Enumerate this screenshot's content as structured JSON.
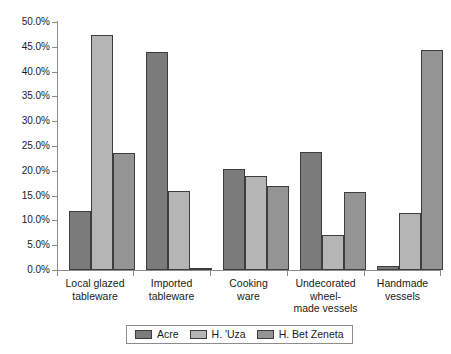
{
  "chart_data": {
    "type": "bar",
    "title": "",
    "subtitle": "",
    "xlabel": "",
    "ylabel": "",
    "ylim": [
      0,
      50
    ],
    "y_tick_step": 5,
    "y_tick_labels": [
      "0.0%",
      "5.0%",
      "10.0%",
      "15.0%",
      "20.0%",
      "25.0%",
      "30.0%",
      "35.0%",
      "40.0%",
      "45.0%",
      "50.0%"
    ],
    "y_tick_values": [
      0,
      5,
      10,
      15,
      20,
      25,
      30,
      35,
      40,
      45,
      50
    ],
    "value_unit": "%",
    "grid": false,
    "legend_position": "bottom",
    "categories": [
      "Local glazed tableware",
      "Imported tableware",
      "Cooking ware",
      "Undecorated wheel-made vessels",
      "Handmade vessels"
    ],
    "category_label_lines": [
      [
        "Local glazed",
        "tableware"
      ],
      [
        "Imported",
        "tableware"
      ],
      [
        "Cooking",
        "ware"
      ],
      [
        "Undecorated",
        "wheel-",
        "made vessels"
      ],
      [
        "Handmade",
        "vessels"
      ]
    ],
    "series": [
      {
        "name": "Acre",
        "color": "#7b7b7b",
        "values": [
          11.9,
          43.9,
          20.4,
          23.8,
          0.8
        ]
      },
      {
        "name": "H. 'Uza",
        "color": "#b5b5b5",
        "values": [
          47.4,
          16.0,
          19.0,
          7.1,
          11.5
        ]
      },
      {
        "name": "H. Bet Zeneta",
        "color": "#949494",
        "values": [
          23.6,
          0.4,
          16.9,
          15.7,
          44.3
        ]
      }
    ]
  },
  "axis": {
    "line_color": "#8c8c8c"
  }
}
